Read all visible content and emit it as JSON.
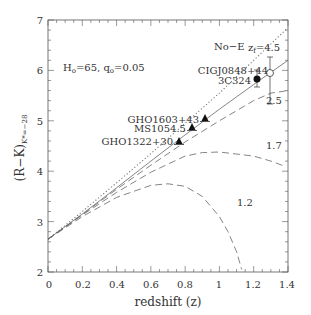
{
  "chart_data": {
    "type": "line",
    "title": "",
    "xlabel": "redshift (z)",
    "ylabel": "(R−K)",
    "ylabel_subscript": "K*=−28",
    "xlim": [
      0,
      1.4
    ],
    "ylim": [
      2,
      7
    ],
    "xticks": [
      "0",
      "0.2",
      "0.4",
      "0.6",
      "0.8",
      "1",
      "1.2",
      "1.4"
    ],
    "yticks": [
      "2",
      "3",
      "4",
      "5",
      "6",
      "7"
    ],
    "grid": false,
    "annotation": "H₀=65, q₀=0.05",
    "series": [
      {
        "name": "No-E",
        "style": "dotted",
        "x": [
          0,
          0.2,
          0.4,
          0.6,
          0.8,
          1.0,
          1.2,
          1.4
        ],
        "y": [
          2.65,
          3.2,
          3.77,
          4.35,
          4.95,
          5.55,
          6.2,
          6.85
        ]
      },
      {
        "name": "z_f=4.5",
        "style": "solid",
        "x": [
          0,
          0.2,
          0.4,
          0.6,
          0.8,
          1.0,
          1.2,
          1.4
        ],
        "y": [
          2.65,
          3.15,
          3.67,
          4.2,
          4.72,
          5.23,
          5.72,
          6.2
        ]
      },
      {
        "name": "2.5",
        "style": "dashed",
        "x": [
          0,
          0.2,
          0.4,
          0.6,
          0.8,
          1.0,
          1.2,
          1.3,
          1.4
        ],
        "y": [
          2.65,
          3.14,
          3.64,
          4.12,
          4.58,
          5.0,
          5.4,
          5.55,
          5.6
        ]
      },
      {
        "name": "1.7",
        "style": "dashed",
        "x": [
          0,
          0.2,
          0.4,
          0.6,
          0.8,
          0.9,
          1.0,
          1.2,
          1.3,
          1.38
        ],
        "y": [
          2.65,
          3.13,
          3.58,
          3.98,
          4.3,
          4.37,
          4.38,
          4.3,
          4.2,
          4.1
        ]
      },
      {
        "name": "1.2",
        "style": "dashed",
        "x": [
          0,
          0.2,
          0.4,
          0.6,
          0.7,
          0.8,
          0.9,
          1.0,
          1.05,
          1.1,
          1.13
        ],
        "y": [
          2.65,
          3.1,
          3.48,
          3.72,
          3.75,
          3.7,
          3.5,
          3.1,
          2.8,
          2.4,
          2.05
        ]
      }
    ],
    "points": [
      {
        "label": "GHO1322+30",
        "x": 0.76,
        "y": 4.6,
        "marker": "triangle"
      },
      {
        "label": "MS1054.5",
        "x": 0.83,
        "y": 4.87,
        "marker": "triangle"
      },
      {
        "label": "GHO1603+43",
        "x": 0.89,
        "y": 5.02,
        "marker": "triangle"
      },
      {
        "label": "3C324",
        "x": 1.21,
        "y": 5.82,
        "marker": "filled-circle",
        "yerr": [
          5.65,
          6.0
        ]
      },
      {
        "label": "CIGJ0848+44",
        "x": 1.27,
        "y": 5.9,
        "marker": "open-circle",
        "yerr": [
          5.35,
          6.35
        ]
      }
    ],
    "curve_labels": [
      {
        "text": "No-E",
        "x": 1.02,
        "y": 6.35
      },
      {
        "text": "z_f=4.5",
        "x": 1.15,
        "y": 6.35
      },
      {
        "text": "2.5",
        "x": 1.3,
        "y": 5.45
      },
      {
        "text": "1.7",
        "x": 1.3,
        "y": 4.5
      },
      {
        "text": "1.2",
        "x": 1.07,
        "y": 3.5
      }
    ]
  },
  "labels": {
    "xlabel": "redshift (z)",
    "ylabel_main": "(R−K)",
    "ylabel_sub": "K*=−28",
    "annotation_h": "H",
    "annotation_h_sub": "o",
    "annotation_h_val": "=65,  q",
    "annotation_q_sub": "o",
    "annotation_q_val": "=0.05",
    "noe": "No−E",
    "zf": "z",
    "zf_sub": "f",
    "zf_val": "=4.5",
    "c25": "2.5",
    "c17": "1.7",
    "c12": "1.2",
    "p_ciq": "CIGJ0848+44",
    "p_3c": "3C324",
    "p_gho1603": "GHO1603+43",
    "p_ms": "MS1054.5",
    "p_gho1322": "GHO1322+30",
    "xt0": "0",
    "xt1": "0.2",
    "xt2": "0.4",
    "xt3": "0.6",
    "xt4": "0.8",
    "xt5": "1",
    "xt6": "1.2",
    "xt7": "1.4",
    "yt2": "2",
    "yt3": "3",
    "yt4": "4",
    "yt5": "5",
    "yt6": "6",
    "yt7": "7"
  }
}
